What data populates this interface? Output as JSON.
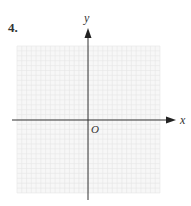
{
  "problem_number": "4.",
  "axes": {
    "x_label": "x",
    "y_label": "y",
    "origin_label": "O"
  },
  "grid": {
    "columns": 30,
    "rows": 30,
    "line_color": "#e6e6e6",
    "axis_color": "#333333"
  }
}
